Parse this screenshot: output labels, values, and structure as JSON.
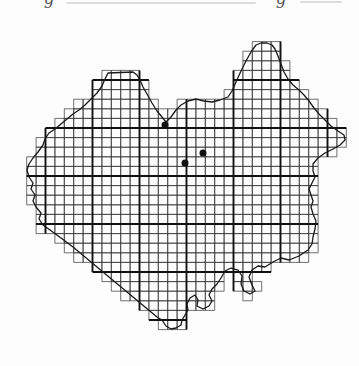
{
  "figure": {
    "type": "grid-distribution-map",
    "background": "#fdfdfd",
    "ink": "#1a1a1a",
    "caption_fragments": [
      {
        "char": "g"
      },
      {
        "char": "g"
      }
    ],
    "map": {
      "grid": {
        "x0": -1.5,
        "cellW": 9.4,
        "iMin": 2,
        "iMax": 36,
        "y0": 32,
        "cellH": 9.6,
        "jMin": 1,
        "jMax": 30,
        "thickEvery": 5,
        "thinColor": "#333333",
        "thinWidth": 0.7,
        "thickColor": "#111111",
        "thickWidth": 1.9
      },
      "outline": {
        "color": "#1a1a1a",
        "width": 1.3,
        "points": [
          [
            108,
            73
          ],
          [
            133,
            72
          ],
          [
            137,
            75
          ],
          [
            140,
            80
          ],
          [
            143,
            87
          ],
          [
            147,
            94
          ],
          [
            152,
            103
          ],
          [
            157,
            111
          ],
          [
            162,
            117
          ],
          [
            166,
            122
          ],
          [
            171,
            117
          ],
          [
            176,
            110
          ],
          [
            181,
            105
          ],
          [
            188,
            101
          ],
          [
            196,
            99
          ],
          [
            204,
            101
          ],
          [
            212,
            102
          ],
          [
            220,
            100
          ],
          [
            228,
            97
          ],
          [
            232,
            91
          ],
          [
            236,
            82
          ],
          [
            241,
            71
          ],
          [
            246,
            61
          ],
          [
            251,
            52
          ],
          [
            256,
            45
          ],
          [
            261,
            43
          ],
          [
            267,
            43
          ],
          [
            272,
            45
          ],
          [
            275,
            49
          ],
          [
            278,
            56
          ],
          [
            281,
            64
          ],
          [
            284,
            72
          ],
          [
            288,
            79
          ],
          [
            293,
            85
          ],
          [
            299,
            90
          ],
          [
            304,
            95
          ],
          [
            309,
            101
          ],
          [
            314,
            108
          ],
          [
            319,
            114
          ],
          [
            325,
            120
          ],
          [
            331,
            126
          ],
          [
            338,
            131
          ],
          [
            344,
            135
          ],
          [
            345,
            140
          ],
          [
            340,
            145
          ],
          [
            333,
            149
          ],
          [
            325,
            153
          ],
          [
            318,
            158
          ],
          [
            313,
            164
          ],
          [
            313,
            171
          ],
          [
            315,
            177
          ],
          [
            312,
            183
          ],
          [
            309,
            189
          ],
          [
            311,
            195
          ],
          [
            313,
            201
          ],
          [
            311,
            207
          ],
          [
            313,
            214
          ],
          [
            316,
            221
          ],
          [
            315,
            229
          ],
          [
            313,
            237
          ],
          [
            312,
            244
          ],
          [
            308,
            250
          ],
          [
            299,
            256
          ],
          [
            289,
            260
          ],
          [
            281,
            258
          ],
          [
            273,
            262
          ],
          [
            265,
            267
          ],
          [
            258,
            266
          ],
          [
            252,
            270
          ],
          [
            249,
            277
          ],
          [
            252,
            285
          ],
          [
            255,
            291
          ],
          [
            250,
            294
          ],
          [
            244,
            291
          ],
          [
            241,
            284
          ],
          [
            242,
            276
          ],
          [
            238,
            270
          ],
          [
            231,
            268
          ],
          [
            225,
            271
          ],
          [
            221,
            278
          ],
          [
            217,
            284
          ],
          [
            212,
            289
          ],
          [
            209,
            295
          ],
          [
            212,
            301
          ],
          [
            209,
            306
          ],
          [
            203,
            309
          ],
          [
            197,
            306
          ],
          [
            198,
            300
          ],
          [
            195,
            295
          ],
          [
            190,
            298
          ],
          [
            187,
            304
          ],
          [
            188,
            310
          ],
          [
            185,
            315
          ],
          [
            182,
            320
          ],
          [
            181,
            325
          ],
          [
            176,
            328
          ],
          [
            171,
            329
          ],
          [
            166,
            326
          ],
          [
            162,
            320
          ],
          [
            157,
            317
          ],
          [
            145,
            307
          ],
          [
            133,
            297
          ],
          [
            121,
            287
          ],
          [
            109,
            277
          ],
          [
            97,
            267
          ],
          [
            85,
            257
          ],
          [
            73,
            247
          ],
          [
            61,
            238
          ],
          [
            50,
            230
          ],
          [
            43,
            225
          ],
          [
            39,
            219
          ],
          [
            41,
            213
          ],
          [
            36,
            207
          ],
          [
            33,
            201
          ],
          [
            35,
            195
          ],
          [
            31,
            189
          ],
          [
            33,
            183
          ],
          [
            29,
            177
          ],
          [
            27,
            170
          ],
          [
            29,
            164
          ],
          [
            33,
            158
          ],
          [
            38,
            152
          ],
          [
            43,
            145
          ],
          [
            45,
            139
          ],
          [
            49,
            133
          ],
          [
            55,
            129
          ],
          [
            61,
            124
          ],
          [
            67,
            119
          ],
          [
            73,
            114
          ],
          [
            79,
            110
          ],
          [
            85,
            105
          ],
          [
            91,
            99
          ],
          [
            97,
            93
          ],
          [
            102,
            86
          ],
          [
            105,
            79
          ]
        ]
      },
      "dots": {
        "color": "#111111",
        "radius": 3.5,
        "points": [
          [
            165,
            125
          ],
          [
            185,
            163
          ],
          [
            203,
            153
          ]
        ]
      }
    }
  }
}
